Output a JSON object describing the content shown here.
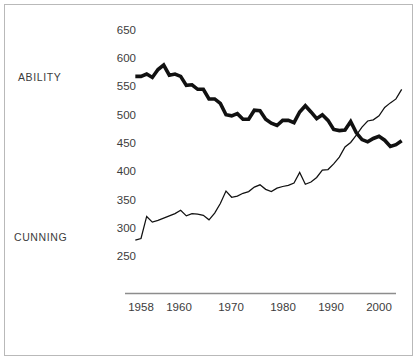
{
  "figure": {
    "background_color": "#ffffff",
    "frame_color": "#b9b9b9",
    "line_color": "#111111",
    "axis_color": "#8d8d8d",
    "text_color": "#3c3c3c"
  },
  "labels": {
    "ability": "ABILITY",
    "cunning": "CUNNING"
  },
  "chart_data": {
    "type": "line",
    "title": "",
    "subtitle": "",
    "xlabel": "",
    "ylabel": "",
    "xlim": [
      1956,
      2005
    ],
    "ylim": [
      240,
      665
    ],
    "grid": false,
    "legend_position": "inline-left",
    "yticks": [
      250,
      300,
      350,
      400,
      450,
      500,
      550,
      600,
      650
    ],
    "ytick_labels": [
      "250",
      "300",
      "350",
      "400",
      "450",
      "500",
      "550",
      "600",
      "650"
    ],
    "xticks": [
      1958,
      1960,
      1970,
      1980,
      1990,
      2000
    ],
    "xtick_labels": [
      "1958",
      "1960",
      "1970",
      "1980",
      "1990",
      "2000"
    ],
    "x": [
      1957,
      1958,
      1959,
      1960,
      1961,
      1962,
      1963,
      1964,
      1965,
      1966,
      1967,
      1968,
      1969,
      1970,
      1971,
      1972,
      1973,
      1974,
      1975,
      1976,
      1977,
      1978,
      1979,
      1980,
      1981,
      1982,
      1983,
      1984,
      1985,
      1986,
      1987,
      1988,
      1989,
      1990,
      1991,
      1992,
      1993,
      1994,
      1995,
      1996,
      1997,
      1998,
      1999,
      2000,
      2001,
      2002,
      2003,
      2004
    ],
    "series": [
      {
        "name": "ABILITY",
        "style": "thick",
        "values": [
          568,
          568,
          572,
          566,
          580,
          588,
          570,
          572,
          568,
          552,
          553,
          545,
          545,
          528,
          528,
          520,
          500,
          498,
          502,
          492,
          492,
          508,
          507,
          492,
          485,
          481,
          490,
          490,
          486,
          505,
          516,
          505,
          493,
          500,
          490,
          474,
          472,
          473,
          488,
          468,
          456,
          452,
          458,
          462,
          455,
          444,
          447,
          454
        ]
      },
      {
        "name": "CUNNING",
        "style": "thin",
        "values": [
          278,
          281,
          320,
          310,
          313,
          317,
          321,
          325,
          331,
          321,
          325,
          324,
          322,
          314,
          326,
          343,
          365,
          354,
          356,
          361,
          364,
          372,
          376,
          368,
          364,
          370,
          373,
          375,
          379,
          398,
          377,
          381,
          389,
          402,
          403,
          413,
          425,
          443,
          451,
          464,
          478,
          489,
          491,
          498,
          513,
          521,
          528,
          545
        ]
      }
    ],
    "annotations": [
      {
        "text": "ABILITY",
        "x_px": 18,
        "y_px": 81
      },
      {
        "text": "CUNNING",
        "x_px": 14,
        "y_px": 241
      }
    ]
  }
}
